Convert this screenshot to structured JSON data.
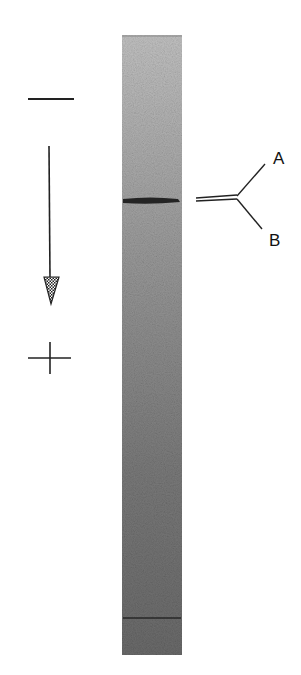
{
  "figure": {
    "polarity": {
      "top_symbol": "−",
      "bottom_symbol": "+",
      "direction": "migration toward positive electrode"
    },
    "gel_lane": {
      "bands": [
        {
          "name": "main-band",
          "relative_position": 0.27,
          "intensity": "strong"
        },
        {
          "name": "lower-band",
          "relative_position": 0.94,
          "intensity": "weak"
        }
      ],
      "background_color_top": "#bcbcbc",
      "background_color_bottom": "#6e6e6e"
    },
    "band_labels": {
      "a": "A",
      "b": "B"
    }
  }
}
